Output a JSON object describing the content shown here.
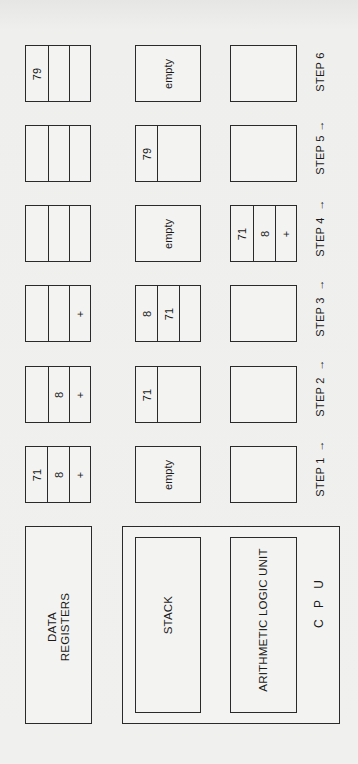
{
  "diagram": {
    "orientation": "rotated-90-ccw",
    "components": {
      "data_registers": "DATA REGISTERS",
      "data_registers_line1": "DATA",
      "data_registers_line2": "REGISTERS",
      "stack": "STACK",
      "alu": "ARITHMETIC LOGIC UNIT",
      "cpu": "C P U"
    },
    "arrow_glyph": "→",
    "steps": [
      {
        "label": "STEP 1",
        "registers": [
          "71",
          "8",
          "+"
        ],
        "stack": {
          "cells": [],
          "empty_label": "empty"
        },
        "alu": []
      },
      {
        "label": "STEP 2",
        "registers": [
          "",
          "8",
          "+"
        ],
        "stack": {
          "cells": [
            "71"
          ]
        },
        "alu": []
      },
      {
        "label": "STEP 3",
        "registers": [
          "",
          "",
          "+"
        ],
        "stack": {
          "cells": [
            "8",
            "71",
            ""
          ]
        },
        "alu": []
      },
      {
        "label": "STEP 4",
        "registers": [
          "",
          "",
          ""
        ],
        "stack": {
          "cells": [],
          "empty_label": "empty"
        },
        "alu": [
          "71",
          "8",
          "+"
        ]
      },
      {
        "label": "STEP 5",
        "registers": [
          "",
          "",
          ""
        ],
        "stack": {
          "cells": [
            "79"
          ]
        },
        "alu": []
      },
      {
        "label": "STEP 6",
        "registers": [
          "79",
          "",
          ""
        ],
        "stack": {
          "cells": [],
          "empty_label": "empty"
        },
        "alu": []
      }
    ]
  }
}
